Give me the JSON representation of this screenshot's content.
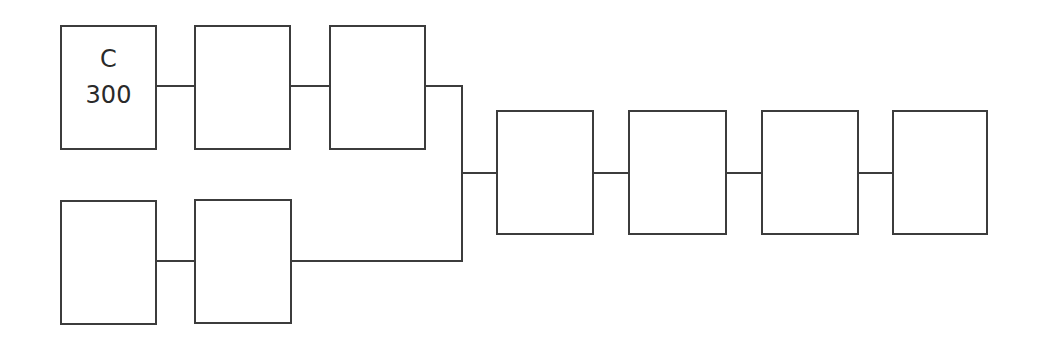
{
  "diagram": {
    "type": "block-diagram",
    "stroke_color": "#3c3c3c",
    "background": "#ffffff",
    "blocks": [
      {
        "id": "top-1",
        "label_line1": "C",
        "label_line2": "300",
        "x": 60,
        "y": 25,
        "w": 97,
        "h": 125
      },
      {
        "id": "top-2",
        "label_line1": "",
        "label_line2": "",
        "x": 194,
        "y": 25,
        "w": 97,
        "h": 125
      },
      {
        "id": "top-3",
        "label_line1": "",
        "label_line2": "",
        "x": 329,
        "y": 25,
        "w": 97,
        "h": 125
      },
      {
        "id": "bottom-1",
        "label_line1": "",
        "label_line2": "",
        "x": 60,
        "y": 200,
        "w": 97,
        "h": 125
      },
      {
        "id": "bottom-2",
        "label_line1": "",
        "label_line2": "",
        "x": 194,
        "y": 199,
        "w": 98,
        "h": 125
      },
      {
        "id": "right-1",
        "label_line1": "",
        "label_line2": "",
        "x": 496,
        "y": 110,
        "w": 98,
        "h": 125
      },
      {
        "id": "right-2",
        "label_line1": "",
        "label_line2": "",
        "x": 628,
        "y": 110,
        "w": 99,
        "h": 125
      },
      {
        "id": "right-3",
        "label_line1": "",
        "label_line2": "",
        "x": 761,
        "y": 110,
        "w": 98,
        "h": 125
      },
      {
        "id": "right-4",
        "label_line1": "",
        "label_line2": "",
        "x": 892,
        "y": 110,
        "w": 96,
        "h": 125
      }
    ],
    "connections": [
      {
        "from": "top-1",
        "to": "top-2"
      },
      {
        "from": "top-2",
        "to": "top-3"
      },
      {
        "from": "top-3",
        "to": "bus"
      },
      {
        "from": "bottom-1",
        "to": "bottom-2"
      },
      {
        "from": "bottom-2",
        "to": "bus"
      },
      {
        "from": "bus",
        "to": "right-1"
      },
      {
        "from": "right-1",
        "to": "right-2"
      },
      {
        "from": "right-2",
        "to": "right-3"
      },
      {
        "from": "right-3",
        "to": "right-4"
      }
    ]
  }
}
